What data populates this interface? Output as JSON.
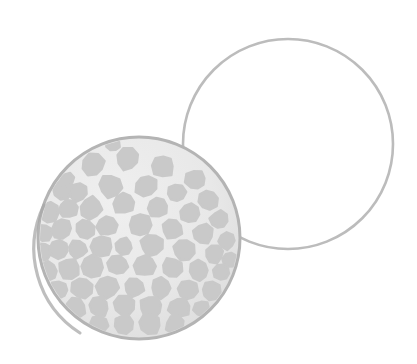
{
  "canvas": {
    "width": 417,
    "height": 364,
    "background_color": "#ffffff",
    "title": "Golf ball and outlined circle illustration"
  },
  "palette": {
    "background": "#ffffff",
    "ball_surface": "#e9e9e9",
    "ball_dimple": "#c9c9c9",
    "ball_rim": "#b4b4b4",
    "ball_rim_shadow": "#a8a8a8",
    "outline_circle_stroke": "#bcbcbc",
    "outline_circle_fill": "none"
  },
  "shapes": {
    "outline_circle": {
      "name": "outline-circle",
      "type": "circle",
      "cx": 288,
      "cy": 144,
      "r": 105,
      "stroke": "#bcbcbc",
      "stroke_width": 2.6,
      "fill": "none",
      "label": "Empty outlined circle"
    },
    "golf_ball": {
      "name": "golf-ball",
      "type": "circle",
      "cx": 139,
      "cy": 238,
      "r": 101,
      "fill": "#e9e9e9",
      "rim_stroke": "#b4b4b4",
      "rim_stroke_width": 3,
      "label": "Dimpled golf ball"
    }
  },
  "dimples": {
    "fill": "#c9c9c9",
    "count": 61,
    "points": [
      {
        "cx": 93,
        "cy": 165,
        "r": 11
      },
      {
        "cx": 128,
        "cy": 159,
        "r": 11
      },
      {
        "cx": 163,
        "cy": 166,
        "r": 11
      },
      {
        "cx": 196,
        "cy": 180,
        "r": 10
      },
      {
        "cx": 63,
        "cy": 190,
        "r": 10
      },
      {
        "cx": 78,
        "cy": 192,
        "r": 9
      },
      {
        "cx": 110,
        "cy": 186,
        "r": 11
      },
      {
        "cx": 146,
        "cy": 186,
        "r": 11
      },
      {
        "cx": 176,
        "cy": 193,
        "r": 9
      },
      {
        "cx": 208,
        "cy": 200,
        "r": 10
      },
      {
        "cx": 49,
        "cy": 212,
        "r": 10
      },
      {
        "cx": 68,
        "cy": 209,
        "r": 9
      },
      {
        "cx": 91,
        "cy": 208,
        "r": 11
      },
      {
        "cx": 124,
        "cy": 203,
        "r": 11
      },
      {
        "cx": 158,
        "cy": 207,
        "r": 10
      },
      {
        "cx": 190,
        "cy": 213,
        "r": 10
      },
      {
        "cx": 219,
        "cy": 220,
        "r": 9
      },
      {
        "cx": 44,
        "cy": 233,
        "r": 9
      },
      {
        "cx": 62,
        "cy": 229,
        "r": 10
      },
      {
        "cx": 85,
        "cy": 229,
        "r": 10
      },
      {
        "cx": 107,
        "cy": 226,
        "r": 10
      },
      {
        "cx": 140,
        "cy": 225,
        "r": 11
      },
      {
        "cx": 172,
        "cy": 229,
        "r": 10
      },
      {
        "cx": 203,
        "cy": 234,
        "r": 10
      },
      {
        "cx": 227,
        "cy": 241,
        "r": 8
      },
      {
        "cx": 43,
        "cy": 252,
        "r": 9
      },
      {
        "cx": 59,
        "cy": 250,
        "r": 9
      },
      {
        "cx": 78,
        "cy": 249,
        "r": 9
      },
      {
        "cx": 101,
        "cy": 247,
        "r": 11
      },
      {
        "cx": 124,
        "cy": 246,
        "r": 8
      },
      {
        "cx": 152,
        "cy": 245,
        "r": 11
      },
      {
        "cx": 184,
        "cy": 250,
        "r": 10
      },
      {
        "cx": 214,
        "cy": 254,
        "r": 9
      },
      {
        "cx": 48,
        "cy": 271,
        "r": 9
      },
      {
        "cx": 69,
        "cy": 269,
        "r": 10
      },
      {
        "cx": 92,
        "cy": 267,
        "r": 11
      },
      {
        "cx": 118,
        "cy": 265,
        "r": 10
      },
      {
        "cx": 145,
        "cy": 266,
        "r": 10
      },
      {
        "cx": 172,
        "cy": 268,
        "r": 10
      },
      {
        "cx": 199,
        "cy": 271,
        "r": 10
      },
      {
        "cx": 222,
        "cy": 272,
        "r": 8
      },
      {
        "cx": 59,
        "cy": 290,
        "r": 9
      },
      {
        "cx": 82,
        "cy": 288,
        "r": 10
      },
      {
        "cx": 107,
        "cy": 287,
        "r": 11
      },
      {
        "cx": 134,
        "cy": 287,
        "r": 10
      },
      {
        "cx": 161,
        "cy": 288,
        "r": 10
      },
      {
        "cx": 188,
        "cy": 290,
        "r": 10
      },
      {
        "cx": 211,
        "cy": 291,
        "r": 9
      },
      {
        "cx": 75,
        "cy": 308,
        "r": 10
      },
      {
        "cx": 99,
        "cy": 307,
        "r": 10
      },
      {
        "cx": 124,
        "cy": 306,
        "r": 10
      },
      {
        "cx": 151,
        "cy": 307,
        "r": 11
      },
      {
        "cx": 179,
        "cy": 308,
        "r": 10
      },
      {
        "cx": 202,
        "cy": 309,
        "r": 8
      },
      {
        "cx": 99,
        "cy": 325,
        "r": 9
      },
      {
        "cx": 124,
        "cy": 324,
        "r": 9
      },
      {
        "cx": 150,
        "cy": 324,
        "r": 10
      },
      {
        "cx": 175,
        "cy": 325,
        "r": 9
      },
      {
        "cx": 67,
        "cy": 180,
        "r": 7
      },
      {
        "cx": 230,
        "cy": 260,
        "r": 7
      },
      {
        "cx": 113,
        "cy": 144,
        "r": 7
      }
    ]
  }
}
